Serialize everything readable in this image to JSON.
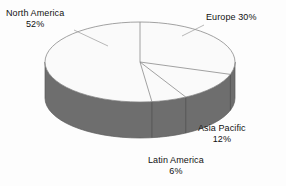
{
  "chart_data": {
    "type": "pie",
    "title": "",
    "subtitle": "",
    "xlabel": "",
    "ylabel": "",
    "legend_position": "none",
    "grid": false,
    "style": "3d-pie",
    "categories": [
      "Europe",
      "Asia Pacific",
      "Latin America",
      "North America"
    ],
    "values": [
      30,
      12,
      6,
      52
    ],
    "unit": "%",
    "slices": [
      {
        "label": "Europe",
        "value": 30,
        "display_value": "30%",
        "start_angle_deg": 0,
        "end_angle_deg": 108,
        "top_color": "#fafafa",
        "side_color": "#6e6e6e"
      },
      {
        "label": "Asia Pacific",
        "value": 12,
        "display_value": "12%",
        "start_angle_deg": 108,
        "end_angle_deg": 151.2,
        "top_color": "#fafafa",
        "side_color": "#6e6e6e"
      },
      {
        "label": "Latin America",
        "value": 6,
        "display_value": "6%",
        "start_angle_deg": 151.2,
        "end_angle_deg": 172.8,
        "top_color": "#fafafa",
        "side_color": "#6e6e6e"
      },
      {
        "label": "North America",
        "value": 52,
        "display_value": "52%",
        "start_angle_deg": 172.8,
        "end_angle_deg": 360,
        "top_color": "#fafafa",
        "side_color": "#6e6e6e"
      }
    ]
  },
  "labels": {
    "north_america": {
      "name": "North America",
      "percent": "52%"
    },
    "europe": {
      "name": "Europe 30%",
      "percent": ""
    },
    "asia_pacific": {
      "name": "Asia Pacific",
      "percent": "12%"
    },
    "latin_america": {
      "name": "Latin America",
      "percent": "6%"
    }
  },
  "colors": {
    "background": "#fdfdfd",
    "pie_top_face": "#fafafa",
    "pie_side_wall": "#6e6e6e",
    "outline": "#8a8a8a",
    "text": "#111111"
  }
}
